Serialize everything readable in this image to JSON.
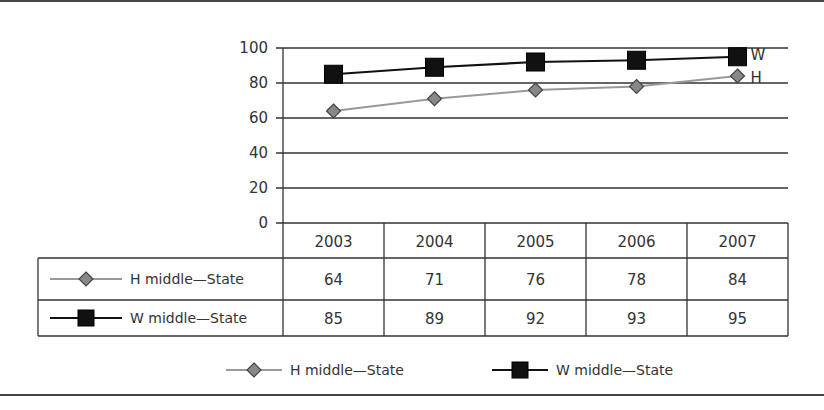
{
  "chart_data": {
    "type": "line",
    "title": "",
    "xlabel": "",
    "ylabel": "",
    "categories": [
      "2003",
      "2004",
      "2005",
      "2006",
      "2007"
    ],
    "series": [
      {
        "name": "H middle—State",
        "end_label": "H",
        "marker": "diamond",
        "color": "#999999",
        "marker_color": "#888888",
        "values": [
          64,
          71,
          76,
          78,
          84
        ]
      },
      {
        "name": "W middle—State",
        "end_label": "W",
        "marker": "square",
        "color": "#111111",
        "marker_color": "#111111",
        "values": [
          85,
          89,
          92,
          93,
          95
        ]
      }
    ],
    "ylim": [
      0,
      100
    ],
    "yticks": [
      "0",
      "20",
      "40",
      "60",
      "80",
      "100"
    ],
    "grid": true,
    "data_table": true,
    "legend_position": "bottom"
  },
  "legend": {
    "items": [
      {
        "label": "H middle—State"
      },
      {
        "label": "W middle—State"
      }
    ]
  }
}
